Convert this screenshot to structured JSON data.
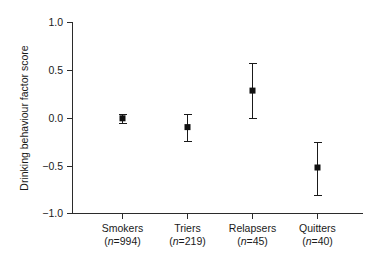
{
  "chart_data": {
    "type": "scatter",
    "title": "",
    "xlabel": "",
    "ylabel": "Drinking behaviour factor score",
    "ylim": [
      -1.0,
      1.0
    ],
    "xlim": [
      0,
      4
    ],
    "grid": false,
    "legend": null,
    "marker": "filled-square",
    "errorbars": "vertical-with-caps",
    "ytick_labels": [
      "1.0",
      "0.5",
      "0.0",
      "−0.5",
      "−1.0"
    ],
    "ytick_values": [
      1.0,
      0.5,
      0.0,
      -0.5,
      -1.0
    ],
    "categories": [
      "Smokers",
      "Triers",
      "Relapsers",
      "Quitters"
    ],
    "category_counts": [
      "(n=994)",
      "(n=219)",
      "(n=45)",
      "(n=40)"
    ],
    "category_n_values": [
      994,
      219,
      45,
      40
    ],
    "values": [
      0.03,
      -0.1,
      0.29,
      -0.51
    ],
    "error_low": [
      -0.03,
      -0.24,
      0.0,
      -0.8
    ],
    "error_high": [
      0.08,
      0.04,
      0.57,
      -0.25
    ],
    "points": [
      {
        "label": "Smokers",
        "n": 994,
        "n_label": "(n=994)",
        "value": 0.03,
        "low": -0.03,
        "high": 0.08
      },
      {
        "label": "Triers",
        "n": 219,
        "n_label": "(n=219)",
        "value": -0.1,
        "low": -0.24,
        "high": 0.04
      },
      {
        "label": "Relapsers",
        "n": 45,
        "n_label": "(n=45)",
        "value": 0.29,
        "low": 0.0,
        "high": 0.57
      },
      {
        "label": "Quitters",
        "n": 40,
        "n_label": "(n=40)",
        "value": -0.51,
        "low": -0.8,
        "high": -0.25
      }
    ],
    "colors": {
      "axis": "#2b2b2b",
      "marker": "#111111",
      "errorbar": "#1a1a1a",
      "background": "#ffffff",
      "text": "#1a1a1a"
    }
  }
}
